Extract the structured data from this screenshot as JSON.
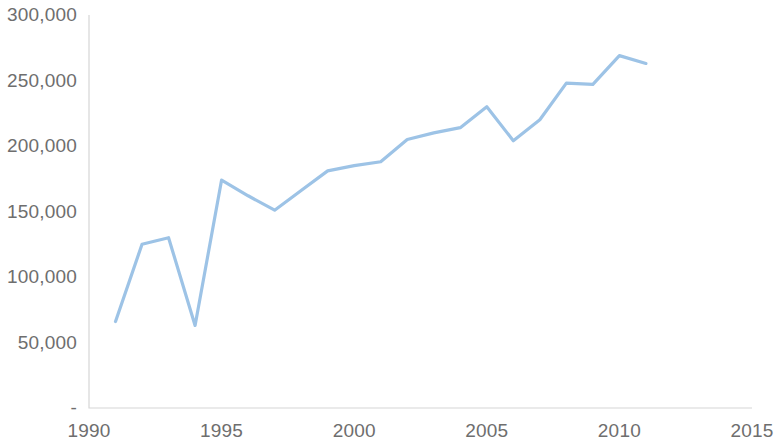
{
  "chart_data": {
    "type": "line",
    "title": "",
    "subtitle": "",
    "xlabel": "",
    "ylabel": "",
    "grid": false,
    "legend": null,
    "legend_position": "none",
    "series_color": "#9DC3E6",
    "axis_color": "#D6D6D6",
    "tick_label_color": "#6E6E6E",
    "xlim": [
      1990,
      2015
    ],
    "ylim": [
      0,
      300000
    ],
    "x_tick_labels": [
      "1990",
      "1995",
      "2000",
      "2005",
      "2010",
      "2015"
    ],
    "x_ticks": [
      1990,
      1995,
      2000,
      2005,
      2010,
      2015
    ],
    "y_tick_labels": [
      "300,000",
      "250,000",
      "200,000",
      "150,000",
      "100,000",
      "50,000",
      "-"
    ],
    "y_ticks": [
      300000,
      250000,
      200000,
      150000,
      100000,
      50000,
      0
    ],
    "series": [
      {
        "name": "series-1",
        "color": "#9DC3E6",
        "x": [
          1991,
          1992,
          1993,
          1994,
          1995,
          1996,
          1997,
          1998,
          1999,
          2000,
          2001,
          2002,
          2003,
          2004,
          2005,
          2006,
          2007,
          2008,
          2009,
          2010,
          2011
        ],
        "values": [
          66000,
          125000,
          130000,
          63000,
          174000,
          162000,
          151000,
          166000,
          181000,
          185000,
          188000,
          205000,
          210000,
          214000,
          230000,
          204000,
          220000,
          248000,
          247000,
          269000,
          263000
        ]
      }
    ]
  }
}
